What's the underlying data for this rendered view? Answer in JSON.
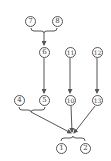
{
  "diagram": {
    "type": "precedence-graph",
    "nodes": [
      {
        "id": "n7",
        "label": "7",
        "x": 30,
        "y": 21
      },
      {
        "id": "n8",
        "label": "8",
        "x": 57,
        "y": 21
      },
      {
        "id": "n6",
        "label": "6",
        "x": 44,
        "y": 52
      },
      {
        "id": "n11",
        "label": "11",
        "x": 71,
        "y": 52
      },
      {
        "id": "n12",
        "label": "12",
        "x": 97,
        "y": 52
      },
      {
        "id": "n4",
        "label": "4",
        "x": 19,
        "y": 100
      },
      {
        "id": "n5",
        "label": "5",
        "x": 45,
        "y": 100
      },
      {
        "id": "n10",
        "label": "10",
        "x": 70,
        "y": 100
      },
      {
        "id": "n13",
        "label": "13",
        "x": 97,
        "y": 100
      },
      {
        "id": "n1",
        "label": "1",
        "x": 61,
        "y": 148
      },
      {
        "id": "n2",
        "label": "2",
        "x": 85,
        "y": 148
      }
    ],
    "edges": [
      {
        "from": [
          "7",
          "8"
        ],
        "to": "6",
        "style": "brace-group"
      },
      {
        "from": "6",
        "to": "5"
      },
      {
        "from": "11",
        "to": "10"
      },
      {
        "from": "12",
        "to": "13"
      },
      {
        "from": [
          "4",
          "5"
        ],
        "to": [
          "1",
          "2"
        ],
        "style": "brace-group"
      },
      {
        "from": "10",
        "to": [
          "1",
          "2"
        ]
      },
      {
        "from": "13",
        "to": [
          "1",
          "2"
        ]
      }
    ],
    "colors": {
      "line": "#555555",
      "text": "#444444",
      "background": "#ffffff"
    }
  }
}
